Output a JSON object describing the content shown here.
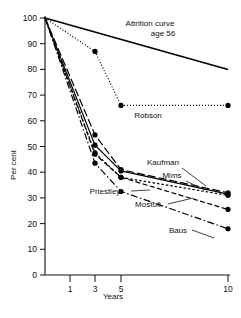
{
  "chart_data": {
    "type": "line",
    "title": "",
    "xlabel": "Years",
    "ylabel": "Per cent",
    "xticks": [
      "1",
      "3",
      "5",
      "10"
    ],
    "xtick_values": [
      1,
      3,
      5,
      10
    ],
    "yticks": [
      "0",
      "10",
      "20",
      "30",
      "40",
      "50",
      "60",
      "70",
      "80",
      "90",
      "100"
    ],
    "ytick_values": [
      0,
      10,
      20,
      30,
      40,
      50,
      60,
      70,
      80,
      90,
      100
    ],
    "ylim": [
      0,
      100
    ],
    "xlim": [
      0,
      10
    ],
    "grid": false,
    "legend_position": "inline-annotations",
    "annotations": [
      {
        "id": "attrition-annotation-line1",
        "text": "Attrition curve",
        "x": 150,
        "y": 26
      },
      {
        "id": "attrition-annotation-line2",
        "text": "age 56",
        "x": 163,
        "y": 36
      }
    ],
    "series": [
      {
        "name": "Attrition curve age 56",
        "label": "",
        "style": "solid",
        "markers": false,
        "x": [
          0,
          10
        ],
        "values": [
          100,
          80
        ]
      },
      {
        "name": "Robson",
        "label": "Robson",
        "style": "dotted",
        "markers": true,
        "x": [
          0,
          3,
          5,
          10
        ],
        "values": [
          100,
          87,
          66,
          66
        ],
        "label_x": 148,
        "label_y": 118
      },
      {
        "name": "Kaufman",
        "label": "Kaufman",
        "style": "longdash",
        "markers": true,
        "x": [
          0,
          3,
          5,
          10
        ],
        "values": [
          100,
          54.5,
          41,
          32
        ],
        "label_x": 163,
        "label_y": 165
      },
      {
        "name": "Mims",
        "label": "Mims",
        "style": "solid",
        "markers": true,
        "x": [
          0,
          3,
          5,
          10
        ],
        "values": [
          100,
          50.5,
          40.5,
          31.5
        ],
        "label_x": 172,
        "label_y": 178
      },
      {
        "name": "Priestley",
        "label": "Priestley",
        "style": "shortdash",
        "markers": true,
        "x": [
          0,
          3,
          5,
          10
        ],
        "values": [
          100,
          47.5,
          38,
          31
        ],
        "label_x": 105,
        "label_y": 194
      },
      {
        "name": "Mostofi",
        "label": "Mostofi",
        "style": "dashed",
        "markers": true,
        "x": [
          0,
          3,
          5,
          10
        ],
        "values": [
          100,
          47,
          38,
          25.5
        ],
        "label_x": 148,
        "label_y": 207
      },
      {
        "name": "Baus",
        "label": "Baus",
        "style": "dashdot",
        "markers": true,
        "x": [
          0,
          3,
          5,
          10
        ],
        "values": [
          100,
          43.5,
          32.5,
          18
        ],
        "label_x": 178,
        "label_y": 233
      }
    ],
    "colors": {
      "axis": "#111111",
      "line": "#000000",
      "marker": "#000000",
      "background": "#ffffff"
    }
  }
}
